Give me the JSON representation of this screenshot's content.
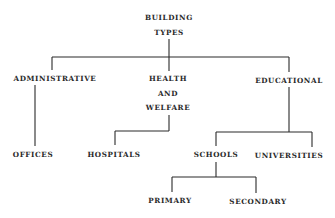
{
  "diagram": {
    "type": "tree",
    "root": {
      "id": "building-types",
      "lines": [
        "BUILDING",
        "TYPES"
      ],
      "children": [
        {
          "id": "administrative",
          "lines": [
            "ADMINISTRATIVE"
          ],
          "children": [
            {
              "id": "offices",
              "lines": [
                "OFFICES"
              ]
            }
          ]
        },
        {
          "id": "health-and-welfare",
          "lines": [
            "HEALTH",
            "AND",
            "WELFARE"
          ],
          "children": [
            {
              "id": "hospitals",
              "lines": [
                "HOSPITALS"
              ]
            }
          ]
        },
        {
          "id": "educational",
          "lines": [
            "EDUCATIONAL"
          ],
          "children": [
            {
              "id": "schools",
              "lines": [
                "SCHOOLS"
              ],
              "children": [
                {
                  "id": "primary",
                  "lines": [
                    "PRIMARY"
                  ]
                },
                {
                  "id": "secondary",
                  "lines": [
                    "SECONDARY"
                  ]
                }
              ]
            },
            {
              "id": "universities",
              "lines": [
                "UNIVERSITIES"
              ]
            }
          ]
        }
      ]
    },
    "edges": [
      [
        "building-types",
        "administrative"
      ],
      [
        "building-types",
        "health-and-welfare"
      ],
      [
        "building-types",
        "educational"
      ],
      [
        "administrative",
        "offices"
      ],
      [
        "health-and-welfare",
        "hospitals"
      ],
      [
        "educational",
        "schools"
      ],
      [
        "educational",
        "universities"
      ],
      [
        "schools",
        "primary"
      ],
      [
        "schools",
        "secondary"
      ]
    ],
    "colors": {
      "ink": "#2a2a2a",
      "background": "#ffffff"
    }
  }
}
